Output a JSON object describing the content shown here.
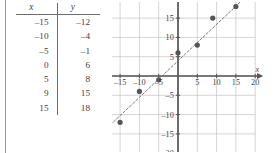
{
  "figure": {
    "left_rule": "vertical-margin-rule"
  },
  "table": {
    "headers": [
      "x",
      "y"
    ],
    "rows": [
      [
        "–15",
        "–12"
      ],
      [
        "–10",
        "–4"
      ],
      [
        "–5",
        "–1"
      ],
      [
        "0",
        "6"
      ],
      [
        "5",
        "8"
      ],
      [
        "9",
        "15"
      ],
      [
        "15",
        "18"
      ]
    ]
  },
  "chart_data": {
    "type": "scatter",
    "title": "",
    "xlabel": "x",
    "ylabel": "y",
    "xlim": [
      -22,
      22
    ],
    "ylim": [
      -22,
      22
    ],
    "grid": true,
    "grid_step": 5,
    "legend": "none",
    "x_ticks": [
      -20,
      -15,
      -10,
      -5,
      5,
      10,
      15,
      20
    ],
    "x_tick_labels": [
      "–20",
      "–15",
      "–10",
      "–5",
      "5",
      "10",
      "15",
      "20"
    ],
    "y_ticks": [
      20,
      15,
      10,
      5,
      -5,
      -10,
      -15,
      -20
    ],
    "y_tick_labels": [
      "20",
      "15",
      "10",
      "5",
      "–5",
      "–10",
      "–15",
      "–20"
    ],
    "points": [
      {
        "x": -15,
        "y": -12
      },
      {
        "x": -10,
        "y": -4
      },
      {
        "x": -5,
        "y": -1
      },
      {
        "x": 0,
        "y": 6
      },
      {
        "x": 5,
        "y": 8
      },
      {
        "x": 9,
        "y": 15
      },
      {
        "x": 15,
        "y": 18
      }
    ],
    "trend_line": {
      "style": "dashed",
      "x_start": -20,
      "y_start": -15,
      "x_end": 17,
      "y_end": 20
    },
    "colors": {
      "point": "#555555",
      "axis": "#555555",
      "grid": "#b8b8b8",
      "trend": "#6b6b6b",
      "text": "#3f3f3f"
    }
  }
}
